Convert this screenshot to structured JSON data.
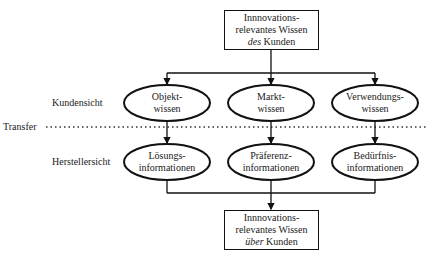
{
  "top_box": {
    "line1": "Innnovations-",
    "line2": "relevantes Wissen",
    "line3_italic": "des",
    "line3_rest": " Kunden"
  },
  "bottom_box": {
    "line1": "Innnovations-",
    "line2": "relevantes Wissen",
    "line3_italic": "über",
    "line3_rest": " Kunden"
  },
  "row_labels": {
    "kundensicht": "Kundensicht",
    "transfer": "Transfer",
    "herstellersicht": "Herstellersicht"
  },
  "kunden_nodes": [
    {
      "line1": "Objekt-",
      "line2": "wissen"
    },
    {
      "line1": "Markt-",
      "line2": "wissen"
    },
    {
      "line1": "Verwendungs-",
      "line2": "wissen"
    }
  ],
  "hersteller_nodes": [
    {
      "line1": "Lösungs-",
      "line2": "informationen"
    },
    {
      "line1": "Präferenz-",
      "line2": "informationen"
    },
    {
      "line1": "Bedürfnis-",
      "line2": "informationen"
    }
  ]
}
